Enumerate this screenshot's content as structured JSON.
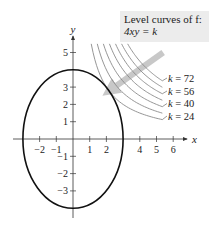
{
  "caption": {
    "line1": "Level curves of f:",
    "line2": "4xy = k",
    "background": "#ececec"
  },
  "axes": {
    "x_label": "x",
    "y_label": "y",
    "x_ticks": [
      {
        "value": -2,
        "label": "−2"
      },
      {
        "value": -1,
        "label": "−1"
      },
      {
        "value": 1,
        "label": "1"
      },
      {
        "value": 2,
        "label": "2"
      },
      {
        "value": 4,
        "label": "4"
      },
      {
        "value": 5,
        "label": "5"
      },
      {
        "value": 6,
        "label": "6"
      }
    ],
    "y_ticks": [
      {
        "value": 5,
        "label": "5"
      },
      {
        "value": 3,
        "label": "3"
      },
      {
        "value": 2,
        "label": "2"
      },
      {
        "value": 1,
        "label": "1"
      },
      {
        "value": -1,
        "label": "−1"
      },
      {
        "value": -2,
        "label": "−2"
      },
      {
        "value": -3,
        "label": "−3"
      }
    ],
    "x_range": [
      -3.6,
      6.8
    ],
    "y_range": [
      -4.6,
      6.2
    ]
  },
  "ellipse": {
    "center": [
      0,
      0
    ],
    "semi_axis_x": 3,
    "semi_axis_y": 4,
    "color": "#111111"
  },
  "level_curves": {
    "k_values": [
      24,
      32,
      40,
      48,
      56,
      64,
      72
    ],
    "labeled": [
      {
        "k": 72,
        "label": "k = 72"
      },
      {
        "k": 56,
        "label": "k = 56"
      },
      {
        "k": 40,
        "label": "k = 40"
      },
      {
        "k": 24,
        "label": "k = 24"
      }
    ],
    "color": "#8a8a8a"
  },
  "gradient_arrow": {
    "from": [
      5.4,
      5.0
    ],
    "to": [
      2.2,
      2.8
    ],
    "color": "#c8c8c8"
  }
}
